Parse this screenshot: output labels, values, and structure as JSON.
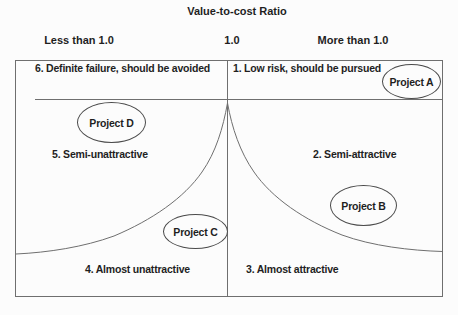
{
  "title": "Value-to-cost Ratio",
  "axis": {
    "left_label": "Less than 1.0",
    "center_label": "1.0",
    "right_label": "More than 1.0"
  },
  "regions": [
    {
      "label": "6. Definite failure, should be avoided"
    },
    {
      "label": "1. Low risk, should be pursued"
    },
    {
      "label": "5. Semi-unattractive"
    },
    {
      "label": "2. Semi-attractive"
    },
    {
      "label": "4. Almost unattractive"
    },
    {
      "label": "3. Almost attractive"
    }
  ],
  "projects": [
    {
      "label": "Project A"
    },
    {
      "label": "Project B"
    },
    {
      "label": "Project C"
    },
    {
      "label": "Project D"
    }
  ],
  "colors": {
    "background": "#fcfcfc",
    "line": "#6f6f6f",
    "ellipse_border": "#4a4a4a",
    "text": "#1f1f1f"
  }
}
